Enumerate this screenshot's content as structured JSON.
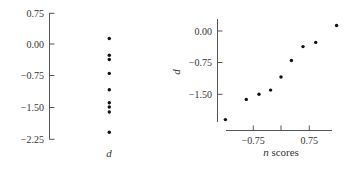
{
  "chart_data": [
    {
      "type": "scatter",
      "subtype": "dot-plot",
      "title": "",
      "xlabel": "d",
      "ylabel": "",
      "ylim": [
        -2.25,
        0.75
      ],
      "yticks": [
        "0.75",
        "0.00",
        "-0.75",
        "-1.50",
        "-2.25"
      ],
      "ytick_values": [
        0.75,
        0.0,
        -0.75,
        -1.5,
        -2.25
      ],
      "grid": false,
      "values": [
        0.13,
        -0.27,
        -0.37,
        -0.7,
        -1.09,
        -1.4,
        -1.5,
        -1.62,
        -2.1
      ]
    },
    {
      "type": "scatter",
      "subtype": "normal-probability-plot",
      "title": "",
      "xlabel": "n scores",
      "ylabel": "d",
      "xlim": [
        -1.6,
        1.5
      ],
      "ylim": [
        -2.2,
        0.3
      ],
      "xticks": [
        "-0.75",
        "",
        "0.75"
      ],
      "xtick_values": [
        -0.75,
        0.0,
        0.75
      ],
      "yticks": [
        "0.00",
        "-0.75",
        "-1.50"
      ],
      "ytick_values": [
        0.0,
        -0.75,
        -1.5
      ],
      "grid": false,
      "x": [
        -1.49,
        -0.93,
        -0.59,
        -0.28,
        0.0,
        0.28,
        0.59,
        0.93,
        1.49
      ],
      "y": [
        -2.1,
        -1.62,
        -1.5,
        -1.4,
        -1.09,
        -0.7,
        -0.37,
        -0.27,
        0.13
      ]
    }
  ],
  "labels": {
    "left": {
      "yticks": [
        "0.75",
        "0.00",
        "−0.75",
        "−1.50",
        "−2.25"
      ],
      "xlabel": "d"
    },
    "right": {
      "yticks": [
        "0.00",
        "−0.75",
        "−1.50"
      ],
      "xticks": [
        "−0.75",
        "0.75"
      ],
      "xlabel_italic": "n",
      "xlabel_rest": " scores",
      "ylabel": "d"
    }
  }
}
